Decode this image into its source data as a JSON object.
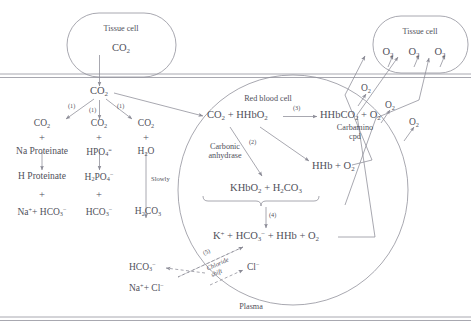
{
  "diagram": {
    "line_color": "#8b8b96",
    "text_color": "#50505a",
    "background": "#ffffff"
  },
  "tissue_cell_left": {
    "label": "Tissue cell",
    "contents": "CO",
    "contents_sub": "2"
  },
  "tissue_cell_right": {
    "label": "Tissue cell",
    "oxygen": [
      "O",
      "O",
      "O"
    ],
    "oxygen_sub": "2"
  },
  "plasma": {
    "label": "Plasma",
    "co2": "CO",
    "co2_sub": "2"
  },
  "red_blood_cell": {
    "label": "Red blood cell"
  },
  "reaction_numbers": {
    "n1": "(1)",
    "n2": "(2)",
    "n3": "(3)",
    "n4": "(4)",
    "n5": "(5)"
  },
  "left_branches": [
    {
      "name": "protein-buffer",
      "row1_a": "CO",
      "row1_a_sub": "2",
      "row1_plus": "+",
      "row1_b": "Na Proteinate",
      "row2": "H Proteinate",
      "row2_plus": "+",
      "row3": "Na",
      "row3_sup": "+",
      "row3_mid": "+",
      "row3_b": "HCO",
      "row3_b_sub": "3",
      "row3_b_sup": "−",
      "arrow_note": ""
    },
    {
      "name": "phosphate-buffer",
      "row1_a": "CO",
      "row1_a_sub": "2",
      "row1_plus": "+",
      "row1_b": "HPO",
      "row1_b_sub": "4",
      "row1_b_sup": "=",
      "row2": "H",
      "row2_sub": "2",
      "row2_b": "PO",
      "row2_b_sub": "4",
      "row2_b_sup": "−",
      "row2_plus": "+",
      "row3_b": "HCO",
      "row3_b_sub": "3",
      "row3_b_sup": "−",
      "arrow_note": ""
    },
    {
      "name": "water-hydration",
      "row1_a": "CO",
      "row1_a_sub": "2",
      "row1_plus": "+",
      "row1_b": "H",
      "row1_b_sub": "2",
      "row1_b_c": "O",
      "arrow_note": "Slowly",
      "row3_b": "H",
      "row3_b_sub": "2",
      "row3_b_c": "CO",
      "row3_b_sub2": "3"
    }
  ],
  "rbc_reactions": {
    "line1_left": "CO",
    "line1_left_sub": "2",
    "line1_plus": "+",
    "line1_mid": "HHbO",
    "line1_mid_sub": "2",
    "line1_right": "HHbCO",
    "line1_right_sub": "2",
    "line1_right_plus": "+",
    "line1_right_o2": "O",
    "line1_right_o2_sub": "2",
    "carbamino_line1": "Carbamino",
    "carbamino_line2": "cpd",
    "carbonic_line1": "Carbonic",
    "carbonic_line2": "anhydrase",
    "hhb_o2": "HHb",
    "hhb_plus": "+",
    "hhb_o2_b": "O",
    "hhb_o2_b_sub": "2",
    "khbo2": "KHbO",
    "khbo2_sub": "2",
    "khbo2_plus": "+",
    "h2co3": "H",
    "h2co3_sub": "2",
    "h2co3_b": "CO",
    "h2co3_b_sub": "3",
    "products_k": "K",
    "products_k_sup": "+",
    "products_plus1": "+",
    "products_hco3": "HCO",
    "products_hco3_sub": "3",
    "products_hco3_sup": "−",
    "products_plus2": "+",
    "products_hhb": "HHb",
    "products_plus3": "+",
    "products_o2": "O",
    "products_o2_sub": "2"
  },
  "chloride_shift": {
    "label_line1": "Chloride",
    "label_line2": "shift",
    "hco3": "HCO",
    "hco3_sub": "3",
    "hco3_sup": "−",
    "na": "Na",
    "na_sup": "+",
    "na_plus": "+",
    "cl_left": "Cl",
    "cl_left_sup": "−",
    "cl_right": "Cl",
    "cl_right_sup": "−"
  },
  "plasma_oxygen": [
    {
      "label": "O",
      "sub": "2"
    },
    {
      "label": "O",
      "sub": "2"
    },
    {
      "label": "O",
      "sub": "2"
    }
  ]
}
